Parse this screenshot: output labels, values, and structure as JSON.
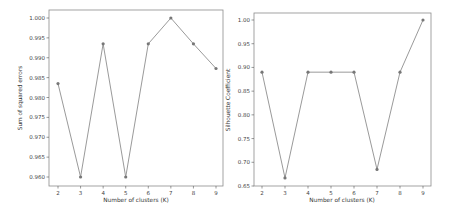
{
  "chart_data": [
    {
      "type": "line",
      "title": "",
      "xlabel": "Number of clusters (K)",
      "ylabel": "Sum of squared errors",
      "x": [
        2,
        3,
        4,
        5,
        6,
        7,
        8,
        9
      ],
      "values": [
        0.9835,
        0.96,
        0.9935,
        0.96,
        0.9935,
        1.0,
        0.9935,
        0.9873
      ],
      "xticks": [
        "2",
        "3",
        "4",
        "5",
        "6",
        "7",
        "8",
        "9"
      ],
      "yticks": [
        "0.960",
        "0.965",
        "0.970",
        "0.975",
        "0.980",
        "0.985",
        "0.990",
        "0.995",
        "1.000"
      ],
      "ylim": [
        0.9585,
        1.0015
      ],
      "grid": false,
      "legend": null,
      "line_color": "#9a9a9a",
      "marker_color": "#777777"
    },
    {
      "type": "line",
      "title": "",
      "xlabel": "Number of clusters (K)",
      "ylabel": "Silhouette Coefficient",
      "x": [
        2,
        3,
        4,
        5,
        6,
        7,
        8,
        9
      ],
      "values": [
        0.89,
        0.667,
        0.89,
        0.89,
        0.89,
        0.685,
        0.89,
        1.0
      ],
      "xticks": [
        "2",
        "3",
        "4",
        "5",
        "6",
        "7",
        "8",
        "9"
      ],
      "yticks": [
        "0.65",
        "0.70",
        "0.75",
        "0.80",
        "0.85",
        "0.90",
        "0.95",
        "1.00"
      ],
      "ylim": [
        0.65,
        1.017
      ],
      "grid": false,
      "legend": null,
      "line_color": "#9a9a9a",
      "marker_color": "#777777"
    }
  ]
}
